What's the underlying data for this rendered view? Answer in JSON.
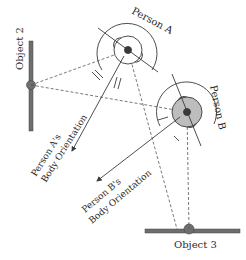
{
  "diagram": {
    "people": [
      {
        "id": "A",
        "label": "Person A",
        "orientation_label_line1": "Person A's",
        "orientation_label_line2": "Body Orientation"
      },
      {
        "id": "B",
        "label": "Person B",
        "orientation_label_line1": "Person B's",
        "orientation_label_line2": "Body Orientation"
      }
    ],
    "objects": [
      {
        "id": "2",
        "label": "Object 2"
      },
      {
        "id": "3",
        "label": "Object 3"
      }
    ],
    "colors": {
      "line": "#3a3a3a",
      "object_bar": "#6e6e6e",
      "person_b_fill": "#bdbdbd",
      "background": "#ffffff"
    }
  }
}
